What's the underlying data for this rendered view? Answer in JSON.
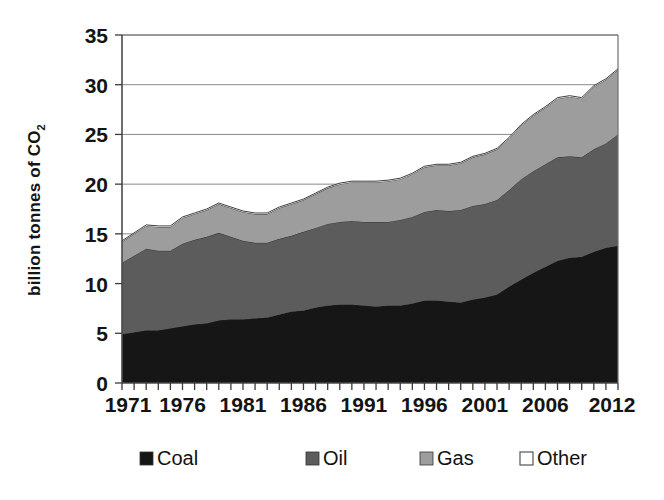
{
  "chart_data": {
    "type": "area",
    "stacked": true,
    "title": "",
    "xlabel": "",
    "ylabel": "billion tonnes of CO2",
    "ylabel_display": "billion tonnes of CO",
    "ylabel_subscript": "2",
    "ylim": [
      0,
      35
    ],
    "ytick_values": [
      0,
      5,
      10,
      15,
      20,
      25,
      30,
      35
    ],
    "ytick_labels": [
      "0",
      "5",
      "10",
      "15",
      "20",
      "25",
      "30",
      "35"
    ],
    "grid": true,
    "grid_axis": "y",
    "xlim": [
      1971,
      2012
    ],
    "xtick_labels": [
      "1971",
      "1976",
      "1981",
      "1986",
      "1991",
      "1996",
      "2001",
      "2006",
      "2012"
    ],
    "xtick_values": [
      1971,
      1976,
      1981,
      1986,
      1991,
      1996,
      2001,
      2006,
      2012
    ],
    "x": [
      1971,
      1972,
      1973,
      1974,
      1975,
      1976,
      1977,
      1978,
      1979,
      1980,
      1981,
      1982,
      1983,
      1984,
      1985,
      1986,
      1987,
      1988,
      1989,
      1990,
      1991,
      1992,
      1993,
      1994,
      1995,
      1996,
      1997,
      1998,
      1999,
      2000,
      2001,
      2002,
      2003,
      2004,
      2005,
      2006,
      2007,
      2008,
      2009,
      2010,
      2011,
      2012
    ],
    "legend_position": "bottom",
    "series": [
      {
        "name": "Coal",
        "color": "#161616",
        "values": [
          4.9,
          5.1,
          5.3,
          5.3,
          5.5,
          5.7,
          5.9,
          6.0,
          6.3,
          6.4,
          6.4,
          6.5,
          6.6,
          6.9,
          7.2,
          7.3,
          7.6,
          7.8,
          7.9,
          7.9,
          7.8,
          7.7,
          7.8,
          7.8,
          8.0,
          8.3,
          8.3,
          8.2,
          8.1,
          8.4,
          8.6,
          8.9,
          9.7,
          10.4,
          11.1,
          11.7,
          12.3,
          12.6,
          12.7,
          13.2,
          13.6,
          13.8
        ]
      },
      {
        "name": "Oil",
        "color": "#5c5c5c",
        "values": [
          7.2,
          7.7,
          8.2,
          8.0,
          7.8,
          8.3,
          8.5,
          8.7,
          8.8,
          8.3,
          7.9,
          7.6,
          7.5,
          7.6,
          7.6,
          7.9,
          8.0,
          8.2,
          8.3,
          8.4,
          8.4,
          8.5,
          8.4,
          8.6,
          8.7,
          8.9,
          9.1,
          9.1,
          9.3,
          9.4,
          9.4,
          9.5,
          9.7,
          10.1,
          10.2,
          10.3,
          10.4,
          10.2,
          10.0,
          10.3,
          10.5,
          11.2
        ]
      },
      {
        "name": "Gas",
        "color": "#9d9d9d",
        "values": [
          2.1,
          2.2,
          2.3,
          2.4,
          2.4,
          2.6,
          2.6,
          2.7,
          2.9,
          2.9,
          2.9,
          2.9,
          2.9,
          3.1,
          3.2,
          3.2,
          3.4,
          3.6,
          3.8,
          3.9,
          4.0,
          4.0,
          4.1,
          4.1,
          4.3,
          4.5,
          4.5,
          4.6,
          4.7,
          4.9,
          5.0,
          5.1,
          5.2,
          5.4,
          5.6,
          5.7,
          5.9,
          6.0,
          5.9,
          6.3,
          6.4,
          6.5
        ]
      },
      {
        "name": "Other",
        "color": "#ffffff",
        "values": [
          0.1,
          0.1,
          0.1,
          0.1,
          0.1,
          0.1,
          0.1,
          0.1,
          0.1,
          0.1,
          0.1,
          0.1,
          0.1,
          0.1,
          0.1,
          0.1,
          0.1,
          0.1,
          0.1,
          0.1,
          0.1,
          0.1,
          0.1,
          0.1,
          0.1,
          0.1,
          0.1,
          0.1,
          0.1,
          0.1,
          0.1,
          0.1,
          0.1,
          0.1,
          0.1,
          0.1,
          0.1,
          0.1,
          0.1,
          0.1,
          0.1,
          0.1
        ]
      }
    ],
    "totals": [
      14.3,
      15.1,
      15.9,
      15.8,
      15.8,
      16.7,
      17.1,
      17.5,
      18.1,
      17.7,
      17.3,
      17.1,
      17.1,
      17.7,
      18.1,
      18.5,
      19.1,
      19.7,
      20.1,
      20.3,
      20.3,
      20.3,
      20.4,
      20.6,
      21.1,
      21.8,
      22.0,
      22.0,
      22.2,
      22.8,
      23.1,
      23.6,
      24.7,
      26.0,
      27.0,
      27.8,
      28.7,
      28.9,
      28.7,
      29.9,
      30.6,
      31.6
    ]
  },
  "legend": {
    "items": [
      {
        "label": "Coal",
        "color": "#161616",
        "swatch": "filled"
      },
      {
        "label": "Oil",
        "color": "#5c5c5c",
        "swatch": "filled"
      },
      {
        "label": "Gas",
        "color": "#9d9d9d",
        "swatch": "filled"
      },
      {
        "label": "Other",
        "color": "#ffffff",
        "swatch": "outline"
      }
    ]
  }
}
